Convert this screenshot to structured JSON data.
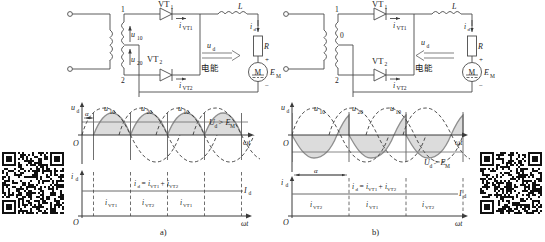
{
  "figure": {
    "caption_a": "a)",
    "caption_b": "b)"
  },
  "circuit_a": {
    "name": "single-phase-full-wave-rectifier-inverting-mode-a",
    "thyristor_1": "VT",
    "thyristor_1_sub": "1",
    "thyristor_2": "VT",
    "thyristor_2_sub": "2",
    "current_vt1": "i",
    "current_vt1_sub": "VT1",
    "current_vt2": "i",
    "current_vt2_sub": "VT2",
    "tap_top": "1",
    "tap_bottom": "2",
    "winding_v1": "u",
    "winding_v1_sub": "10",
    "winding_v2": "u",
    "winding_v2_sub": "20",
    "output_voltage": "u",
    "output_voltage_sub": "d",
    "output_current": "i",
    "output_current_sub": "d",
    "inductor": "L",
    "resistor": "R",
    "motor": "M",
    "emf": "E",
    "emf_sub": "M",
    "power_flow_label": "电能",
    "power_flow_direction": "right",
    "polarity_plus": "+",
    "polarity_minus": "−"
  },
  "circuit_b": {
    "name": "single-phase-full-wave-rectifier-inverting-mode-b",
    "thyristor_1": "VT",
    "thyristor_1_sub": "1",
    "thyristor_2": "VT",
    "thyristor_2_sub": "2",
    "current_vt1": "i",
    "current_vt1_sub": "VT1",
    "current_vt2": "i",
    "current_vt2_sub": "VT2",
    "tap_top": "1",
    "tap_mid": "0",
    "tap_bottom": "2",
    "output_voltage": "u",
    "output_voltage_sub": "d",
    "output_current": "i",
    "output_current_sub": "d",
    "inductor": "L",
    "resistor": "R",
    "motor": "M",
    "emf": "E",
    "emf_sub": "M",
    "power_flow_label": "电能",
    "power_flow_direction": "left",
    "polarity_plus": "+",
    "polarity_minus": "−"
  },
  "chart_data": [
    {
      "id": "voltage-waveform-a",
      "type": "line",
      "title": "",
      "ylabel": "u",
      "ylabel_sub": "d",
      "xlabel": "ωt",
      "alpha_label": "α",
      "alpha_deg": 30,
      "level_label": "U",
      "level_label_sub": "d",
      "level_relation": "> E",
      "level_relation_sub": "M",
      "level_value": 0.55,
      "level_position": "above-axis",
      "series": [
        {
          "name": "u",
          "name_sub": "10",
          "phase_deg": 0,
          "style": "dashed"
        },
        {
          "name": "u",
          "name_sub": "20",
          "phase_deg": 180,
          "style": "dashed"
        },
        {
          "name": "u",
          "name_sub": "10",
          "phase_deg": 360,
          "style": "dashed"
        }
      ],
      "wave_labels": [
        "u10",
        "u20",
        "u10"
      ],
      "output_shaded": true,
      "cycles": 3
    },
    {
      "id": "current-waveform-a",
      "type": "line",
      "ylabel": "i",
      "ylabel_sub": "d",
      "xlabel": "ωt",
      "level_label": "I",
      "level_label_sub": "d",
      "level_value": 1.0,
      "sum_label": "i",
      "sum_label_sub": "d",
      "sum_expression": "= i",
      "sum_expression_sub1": "VT1",
      "sum_expression_mid": "+ i",
      "sum_expression_sub2": "VT2",
      "segments": [
        {
          "label": "i",
          "label_sub": "VT1"
        },
        {
          "label": "i",
          "label_sub": "VT2"
        },
        {
          "label": "i",
          "label_sub": "VT1"
        }
      ]
    },
    {
      "id": "voltage-waveform-b",
      "type": "line",
      "ylabel": "u",
      "ylabel_sub": "d",
      "xlabel": "ωt",
      "alpha_label": "α",
      "alpha_deg": 135,
      "level_label": "U",
      "level_label_sub": "d",
      "level_relation": "> E",
      "level_relation_sub": "M",
      "level_value": -0.55,
      "level_position": "below-axis",
      "wave_labels": [
        "u10",
        "u20",
        "u10"
      ],
      "output_shaded": true,
      "cycles": 3
    },
    {
      "id": "current-waveform-b",
      "type": "line",
      "ylabel": "i",
      "ylabel_sub": "d",
      "xlabel": "ωt",
      "level_label": "I",
      "level_label_sub": "d",
      "level_value": 1.0,
      "sum_label": "i",
      "sum_label_sub": "d",
      "sum_expression": "= i",
      "sum_expression_sub1": "VT1",
      "sum_expression_mid": "+ i",
      "sum_expression_sub2": "VT2",
      "segments": [
        {
          "label": "i",
          "label_sub": "VT2"
        },
        {
          "label": "i",
          "label_sub": "VT1"
        },
        {
          "label": "i",
          "label_sub": "VT2"
        }
      ]
    }
  ],
  "colors": {
    "line": "#4a4a4a",
    "wave_solid": "#8a8a8a",
    "wave_dashed": "#3a3a3a",
    "shade": "#d9d9d9",
    "text": "#1a1a1a"
  }
}
